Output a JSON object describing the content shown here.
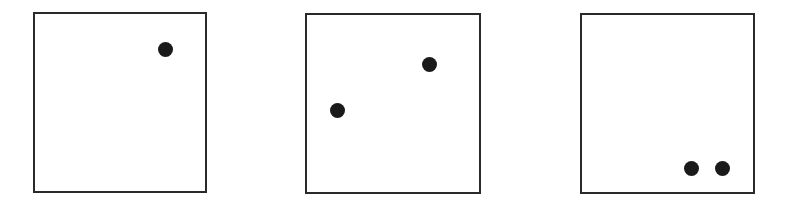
{
  "diagram": {
    "dot_color": "#1a1a1a",
    "border_color": "#2a2a2a",
    "panels": [
      {
        "name": "panel-1",
        "dot_count": 1,
        "dots": [
          {
            "x": 0.77,
            "y": 0.2
          }
        ]
      },
      {
        "name": "panel-2",
        "dot_count": 2,
        "dots": [
          {
            "x": 0.71,
            "y": 0.28
          },
          {
            "x": 0.18,
            "y": 0.54
          }
        ]
      },
      {
        "name": "panel-3",
        "dot_count": 2,
        "dots": [
          {
            "x": 0.64,
            "y": 0.87
          },
          {
            "x": 0.82,
            "y": 0.87
          }
        ]
      }
    ]
  }
}
